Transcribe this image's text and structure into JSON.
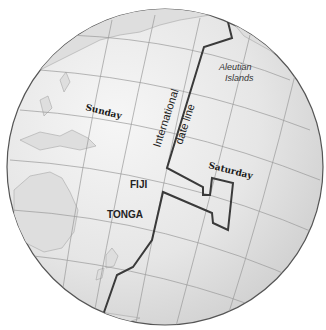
{
  "map": {
    "title": "",
    "colors": {
      "ocean": "#ececec",
      "land": "#dcdcdc",
      "grid": "#9a9a9a",
      "dateline": "#3a3a3a",
      "outline": "#555555"
    },
    "labels": {
      "sunday": "Sunday",
      "saturday": "Saturday",
      "fiji": "FIJI",
      "tonga": "TONGA",
      "aleutian_line1": "Aleutian",
      "aleutian_line2": "Islands",
      "dateline_line1": "International",
      "dateline_line2": "date line"
    }
  }
}
